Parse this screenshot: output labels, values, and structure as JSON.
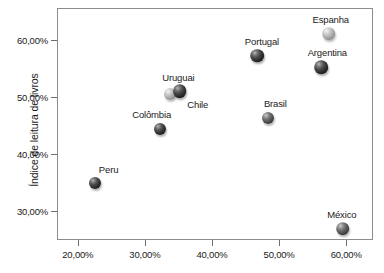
{
  "chart_data": {
    "type": "scatter",
    "title": "",
    "xlabel": "",
    "ylabel": "Índice de leitura de livros",
    "xlim": [
      16.9,
      64.0
    ],
    "ylim": [
      25.0,
      65.5
    ],
    "grid": false,
    "legend": "none",
    "x_tick_labels": [
      "20,00%",
      "30,00%",
      "40,00%",
      "50,00%",
      "60,00%"
    ],
    "x_tick_values": [
      20,
      30,
      40,
      50,
      60
    ],
    "y_tick_labels": [
      "30,00%",
      "40,00%",
      "50,00%",
      "60,00%"
    ],
    "y_tick_values": [
      30,
      40,
      50,
      60
    ],
    "points": [
      {
        "label": "Peru",
        "x": 22.5,
        "y": 35.0,
        "shade": "dark",
        "r": 6.0,
        "label_dx": 14,
        "label_dy": -14
      },
      {
        "label": "Colômbia",
        "x": 32.2,
        "y": 44.4,
        "shade": "dark",
        "r": 6.0,
        "label_dx": -8,
        "label_dy": -15
      },
      {
        "label": "Uruguai",
        "x": 33.8,
        "y": 50.4,
        "shade": "light",
        "r": 6.0,
        "label_dx": 8,
        "label_dy": -17
      },
      {
        "label": "Chile",
        "x": 35.2,
        "y": 51.0,
        "shade": "dark",
        "r": 6.8,
        "label_dx": 18,
        "label_dy": 13
      },
      {
        "label": "Portugal",
        "x": 46.7,
        "y": 57.2,
        "shade": "dark",
        "r": 6.8,
        "label_dx": 5,
        "label_dy": -15
      },
      {
        "label": "Brasil",
        "x": 48.4,
        "y": 46.3,
        "shade": "medium",
        "r": 6.0,
        "label_dx": 7,
        "label_dy": -15
      },
      {
        "label": "Argentina",
        "x": 56.3,
        "y": 55.2,
        "shade": "dark",
        "r": 6.8,
        "label_dx": 6,
        "label_dy": -15
      },
      {
        "label": "Espanha",
        "x": 57.4,
        "y": 61.0,
        "shade": "light",
        "r": 6.8,
        "label_dx": 2,
        "label_dy": -15
      },
      {
        "label": "México",
        "x": 59.5,
        "y": 27.0,
        "shade": "medium",
        "r": 6.8,
        "label_dx": -1,
        "label_dy": -15
      }
    ]
  }
}
